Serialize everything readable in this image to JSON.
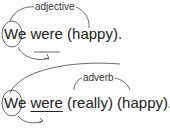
{
  "examples": [
    {
      "label": "adjective",
      "subject": "We",
      "verb": "were",
      "rest": "(happy).",
      "verb_underlined": false
    },
    {
      "label": "adverb",
      "subject": "We",
      "verb": "were",
      "modifier": "(really)",
      "rest": "(happy).",
      "verb_underlined": true
    }
  ]
}
